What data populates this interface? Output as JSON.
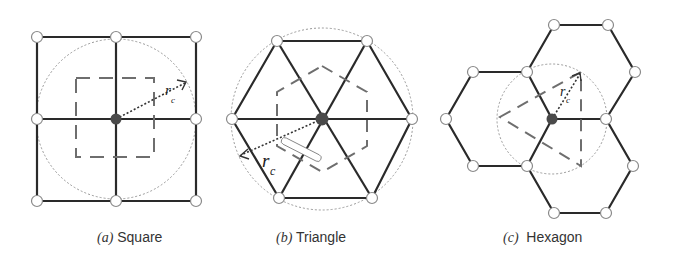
{
  "figure": {
    "panels": [
      {
        "id": "a",
        "label": "(a)",
        "title": "Square",
        "radius_label": "r",
        "radius_subscript": "c"
      },
      {
        "id": "b",
        "label": "(b)",
        "title": "Triangle",
        "radius_label": "r",
        "radius_subscript": "c"
      },
      {
        "id": "c",
        "label": "(c)",
        "title": "Hexagon",
        "radius_label": "r",
        "radius_subscript": "c"
      }
    ]
  },
  "colors": {
    "edge": "#2a2a2a",
    "node_fill": "#ffffff",
    "node_stroke": "#8a8a8a",
    "center_node": "#4a4a4a",
    "dashed_region": "#6e6e6e",
    "dotted_circle": "#9a9a9a",
    "caption_text": "#333333"
  }
}
